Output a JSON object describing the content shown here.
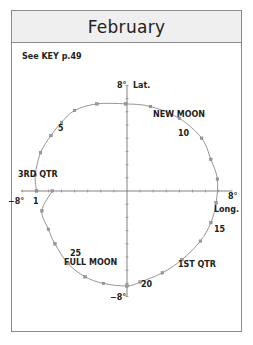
{
  "header": {
    "title": "February"
  },
  "key_note": "See KEY p.49",
  "axes": {
    "lat_label": "Lat.",
    "long_label": "Long.",
    "lat_max": "8°",
    "lat_min": "−8°",
    "long_max": "8°",
    "long_min": "−8°"
  },
  "phases": {
    "new_moon": "NEW MOON",
    "first_quarter": "1ST QTR",
    "full_moon": "FULL MOON",
    "third_quarter": "3RD QTR"
  },
  "day_labels": {
    "d1": "1",
    "d5": "5",
    "d10": "10",
    "d15": "15",
    "d20": "20",
    "d25": "25"
  },
  "colors": {
    "curve": "#8a8a8a",
    "axis": "#666666",
    "text": "#222222",
    "header_bg": "#efefef"
  },
  "chart_data": {
    "type": "scatter",
    "title": "February",
    "xlabel": "Long.",
    "ylabel": "Lat.",
    "xlim": [
      -8,
      8
    ],
    "ylim": [
      -8,
      8
    ],
    "grid": false,
    "series": [
      {
        "name": "Moon libration path",
        "points": [
          {
            "day": 1,
            "x": -6.9,
            "y": 0.0
          },
          {
            "day": 2,
            "x": -7.0,
            "y": 1.2
          },
          {
            "day": 3,
            "x": -6.6,
            "y": 2.9
          },
          {
            "day": 4,
            "x": -5.8,
            "y": 4.2
          },
          {
            "day": 5,
            "x": -5.0,
            "y": 5.2
          },
          {
            "day": 6,
            "x": -4.0,
            "y": 6.1
          },
          {
            "day": 7,
            "x": -2.3,
            "y": 6.6
          },
          {
            "day": 8,
            "x": -0.1,
            "y": 6.6
          },
          {
            "day": 9,
            "x": 1.8,
            "y": 6.4
          },
          {
            "day": 10,
            "x": 4.0,
            "y": 5.5
          },
          {
            "day": 11,
            "x": 5.7,
            "y": 4.0
          },
          {
            "day": 12,
            "x": 6.4,
            "y": 2.4
          },
          {
            "day": 13,
            "x": 6.9,
            "y": 0.9
          },
          {
            "day": 14,
            "x": 6.8,
            "y": -0.9
          },
          {
            "day": 15,
            "x": 6.4,
            "y": -2.4
          },
          {
            "day": 16,
            "x": 5.6,
            "y": -3.8
          },
          {
            "day": 17,
            "x": 4.2,
            "y": -5.2
          },
          {
            "day": 18,
            "x": 2.7,
            "y": -6.2
          },
          {
            "day": 19,
            "x": 1.0,
            "y": -6.9
          },
          {
            "day": 20,
            "x": 0.0,
            "y": -7.2
          },
          {
            "day": 21,
            "x": -1.8,
            "y": -7.0
          },
          {
            "day": 22,
            "x": -3.2,
            "y": -6.5
          },
          {
            "day": 23,
            "x": -4.5,
            "y": -5.5
          },
          {
            "day": 24,
            "x": -5.5,
            "y": -4.0
          },
          {
            "day": 25,
            "x": -6.0,
            "y": -2.9
          },
          {
            "day": 26,
            "x": -6.5,
            "y": -1.5
          },
          {
            "day": 27,
            "x": -5.7,
            "y": 0.0
          }
        ]
      }
    ],
    "annotations": [
      {
        "text": "NEW MOON",
        "near_day": 9
      },
      {
        "text": "1ST QTR",
        "near_day": 17
      },
      {
        "text": "FULL MOON",
        "near_day": 24
      },
      {
        "text": "3RD QTR",
        "near_day": 27
      },
      {
        "text": "1",
        "day": 1
      },
      {
        "text": "5",
        "day": 5
      },
      {
        "text": "10",
        "day": 10
      },
      {
        "text": "15",
        "day": 15
      },
      {
        "text": "20",
        "day": 20
      },
      {
        "text": "25",
        "day": 25
      }
    ]
  }
}
